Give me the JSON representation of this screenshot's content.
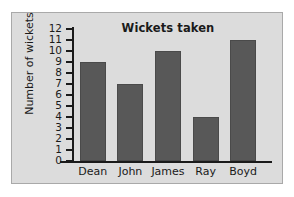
{
  "chart_data": {
    "type": "bar",
    "title": "Wickets taken",
    "xlabel": "",
    "ylabel": "Number of wickets",
    "categories": [
      "Dean",
      "John",
      "James",
      "Ray",
      "Boyd"
    ],
    "values": [
      9,
      7,
      10,
      4,
      11
    ],
    "ylim": [
      0,
      12
    ],
    "ytick_labels": [
      "12",
      "11",
      "10",
      "9",
      "8",
      "7",
      "6",
      "5",
      "4",
      "3",
      "2",
      "1",
      "0"
    ],
    "ytick_values": [
      12,
      11,
      10,
      9,
      8,
      7,
      6,
      5,
      4,
      3,
      2,
      1,
      0
    ],
    "grid": false,
    "legend": false,
    "colors": {
      "bar_fill": "#585858",
      "bar_stroke": "#4a4a4a",
      "panel_background": "#dcdcdc",
      "panel_border": "#a9a9a9",
      "axis": "#1a1a1a",
      "text": "#1a1a1a",
      "page_background": "#ffffff"
    }
  }
}
